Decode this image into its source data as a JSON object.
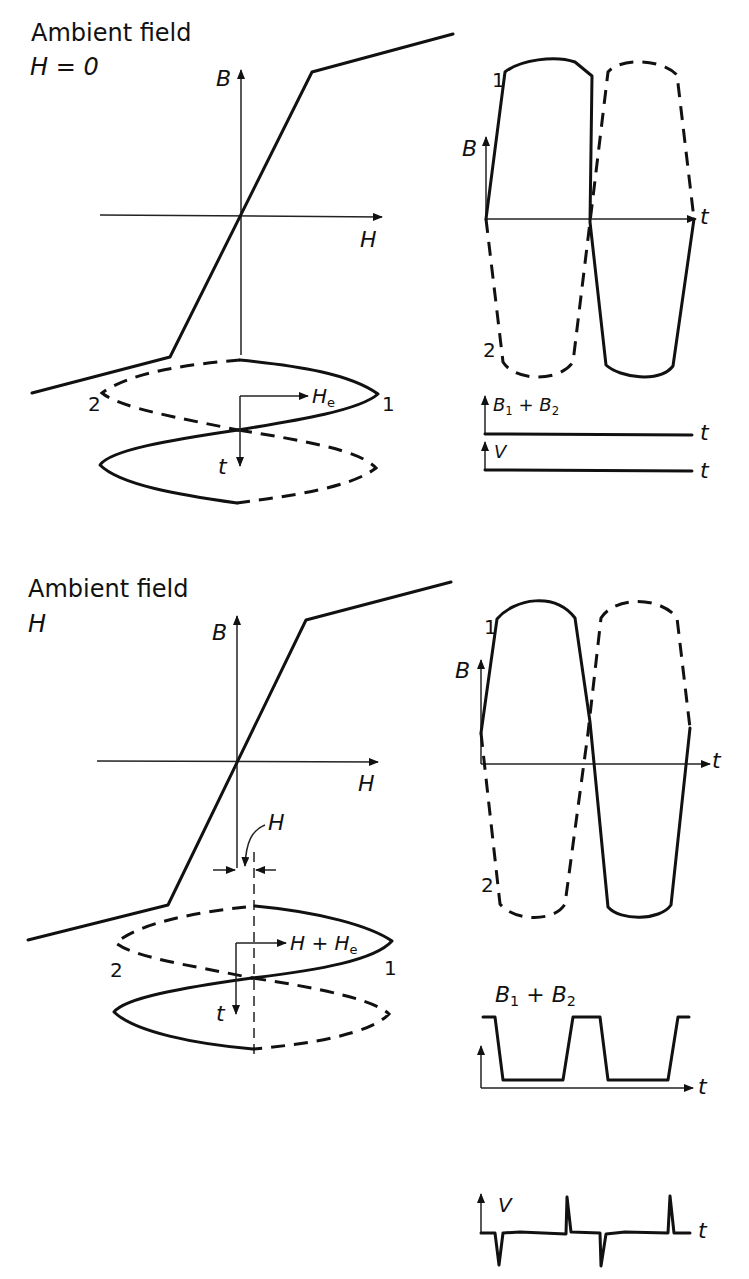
{
  "panels": [
    {
      "title_line1": "Ambient field",
      "title_line2": "H = 0",
      "bh_curve": {
        "y_axis_label": "B",
        "x_axis_label": "H"
      },
      "drive_field": {
        "label": "H",
        "label_sub": "e",
        "time_label": "t",
        "core1_label": "1",
        "core2_label": "2"
      },
      "flux_waveform": {
        "y_axis_label": "B",
        "time_label": "t",
        "core1_label": "1",
        "core2_label": "2"
      },
      "sum_waveform": {
        "label": "B",
        "sub1": "1",
        "plus": " + ",
        "label2": "B",
        "sub2": "2",
        "time_label": "t"
      },
      "voltage_waveform": {
        "label": "V",
        "time_label": "t"
      }
    },
    {
      "title_line1": "Ambient field",
      "title_line2": "H",
      "bh_curve": {
        "y_axis_label": "B",
        "x_axis_label": "H"
      },
      "offset_annotation": "H",
      "drive_field": {
        "label": "H + H",
        "label_sub": "e",
        "time_label": "t",
        "core1_label": "1",
        "core2_label": "2"
      },
      "flux_waveform": {
        "y_axis_label": "B",
        "time_label": "t",
        "core1_label": "1",
        "core2_label": "2"
      },
      "sum_waveform": {
        "label": "B",
        "sub1": "1",
        "plus": " + ",
        "label2": "B",
        "sub2": "2",
        "time_label": "t"
      },
      "voltage_waveform": {
        "label": "V",
        "time_label": "t"
      }
    }
  ]
}
